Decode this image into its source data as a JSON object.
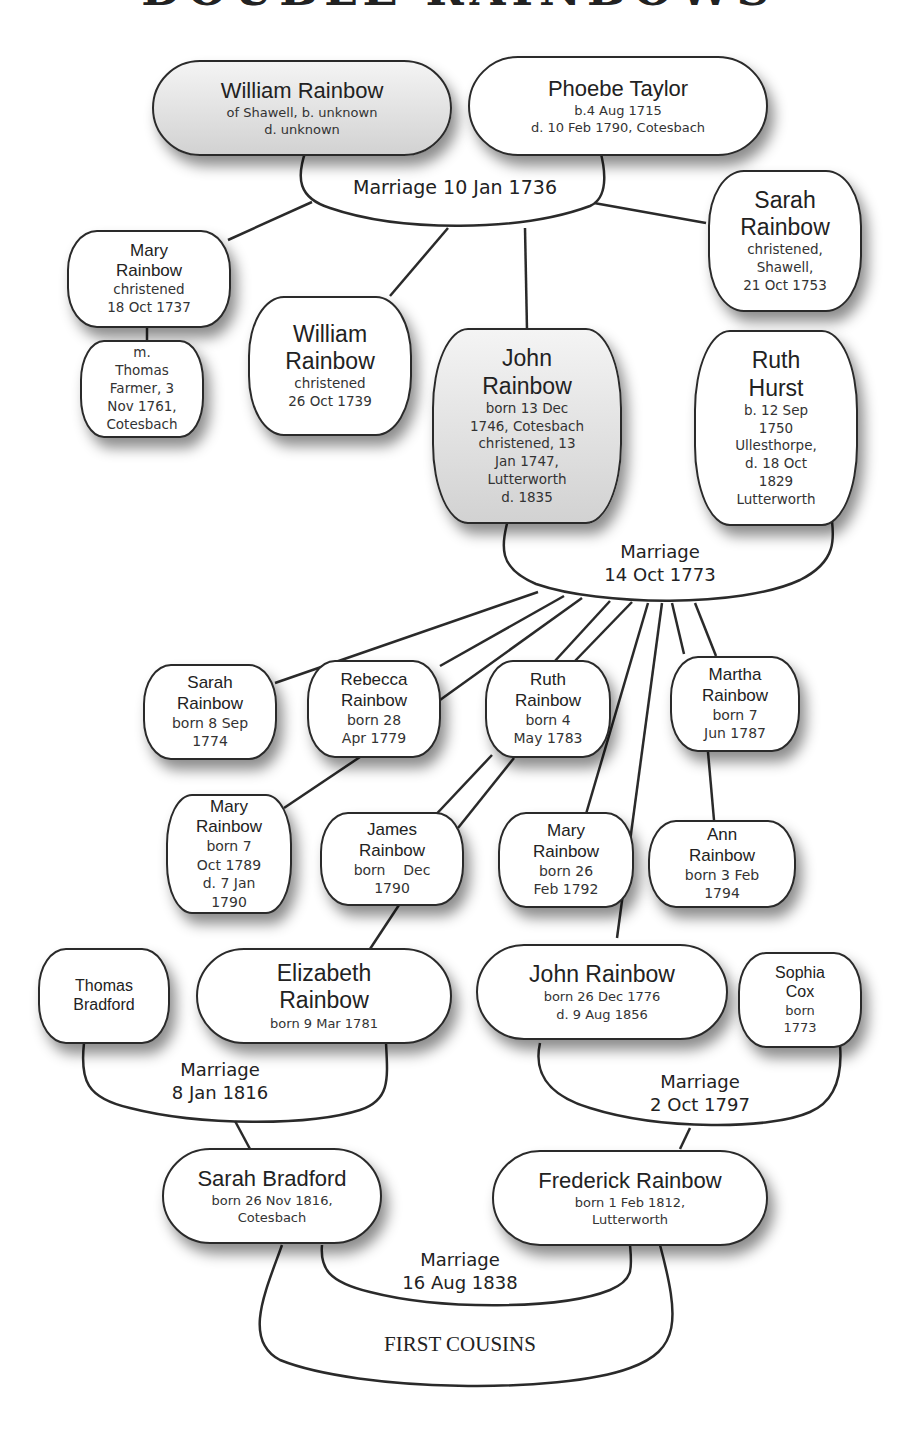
{
  "title": "DOUBLE RAINBOWS",
  "people": {
    "william_sr": {
      "name": "William Rainbow",
      "details": "of Shawell, b. unknown\nd. unknown"
    },
    "phoebe": {
      "name": "Phoebe Taylor",
      "details": "b.4 Aug 1715\nd. 10 Feb 1790, Cotesbach"
    },
    "mary_1737": {
      "name": "Mary\nRainbow",
      "details": "christened\n18 Oct 1737"
    },
    "mary_1737_marriage": {
      "name": "",
      "details": "m.\nThomas\nFarmer, 3\nNov 1761,\nCotesbach"
    },
    "william_1739": {
      "name": "William\nRainbow",
      "details": "christened\n26 Oct 1739"
    },
    "john_1746": {
      "name": "John\nRainbow",
      "details": "born 13 Dec\n1746, Cotesbach\nchristened, 13\nJan 1747,\nLutterworth\nd. 1835"
    },
    "sarah_1753": {
      "name": "Sarah\nRainbow",
      "details": "christened,\nShawell,\n21 Oct 1753"
    },
    "ruth_hurst": {
      "name": "Ruth\nHurst",
      "details": "b. 12 Sep\n1750\nUllesthorpe,\nd. 18 Oct\n1829\nLutterworth"
    },
    "sarah_1774": {
      "name": "Sarah\nRainbow",
      "details": "born 8 Sep\n1774"
    },
    "rebecca_1779": {
      "name": "Rebecca\nRainbow",
      "details": "born 28\nApr 1779"
    },
    "ruth_1783": {
      "name": "Ruth\nRainbow",
      "details": "born 4\nMay 1783"
    },
    "martha_1787": {
      "name": "Martha\nRainbow",
      "details": "born 7\nJun 1787"
    },
    "mary_1789": {
      "name": "Mary\nRainbow",
      "details": "born 7\nOct 1789\nd. 7 Jan\n1790"
    },
    "james_1790": {
      "name": "James\nRainbow",
      "details": "born    Dec\n1790"
    },
    "mary_1792": {
      "name": "Mary\nRainbow",
      "details": "born 26\nFeb 1792"
    },
    "ann_1794": {
      "name": "Ann\nRainbow",
      "details": "born 3 Feb\n1794"
    },
    "thomas_bradford": {
      "name": "Thomas\nBradford",
      "details": ""
    },
    "elizabeth_1781": {
      "name": "Elizabeth\nRainbow",
      "details": "born 9 Mar 1781"
    },
    "john_1776": {
      "name": "John Rainbow",
      "details": "born 26 Dec 1776\nd. 9 Aug 1856"
    },
    "sophia_cox": {
      "name": "Sophia\nCox",
      "details": "born\n1773"
    },
    "sarah_bradford": {
      "name": "Sarah Bradford",
      "details": "born 26 Nov 1816,\nCotesbach"
    },
    "frederick": {
      "name": "Frederick Rainbow",
      "details": "born 1 Feb 1812,\nLutterworth"
    }
  },
  "marriages": {
    "m1736": "Marriage 10 Jan 1736",
    "m1773": "Marriage\n14 Oct 1773",
    "m1816": "Marriage\n8 Jan 1816",
    "m1797": "Marriage\n2 Oct 1797",
    "m1838": "Marriage\n16 Aug 1838"
  },
  "annotations": {
    "first_cousins": "FIRST COUSINS"
  },
  "colors": {
    "line": "#2a2a2a",
    "node_fill": "#ffffff",
    "highlight_fill": "#d2d2d2"
  }
}
